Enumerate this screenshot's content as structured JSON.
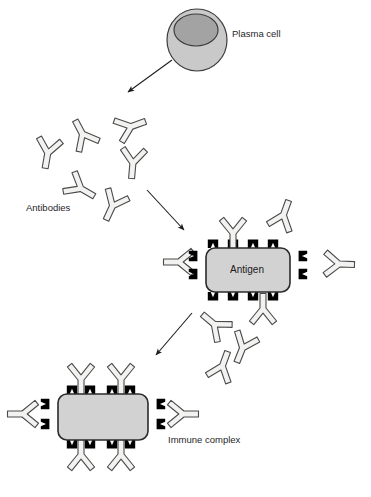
{
  "diagram": {
    "canvas": {
      "width": 371,
      "height": 497,
      "background": "#ffffff"
    },
    "palette": {
      "outline": "#3a3a3a",
      "antibody_fill": "#f2f2f0",
      "antibody_stroke": "#4a4a4a",
      "antigen_fill": "#d2d2d2",
      "antigen_stroke": "#2b2b2b",
      "epitope_fill": "#000000",
      "cell_cytoplasm": "#c9c9c9",
      "cell_nucleus": "#a3a3a3",
      "cell_stroke": "#3d3d3d",
      "arrow": "#1c1c1c",
      "text": "#262626"
    },
    "labels": [
      {
        "id": "plasma-cell",
        "text": "Plasma cell",
        "x": 232,
        "y": 34,
        "anchor": "start"
      },
      {
        "id": "antibodies",
        "text": "Antibodies",
        "x": 26,
        "y": 208,
        "anchor": "start"
      },
      {
        "id": "immune-complex",
        "text": "Immune complex",
        "x": 168,
        "y": 440,
        "anchor": "start"
      }
    ],
    "antigen_label": {
      "text": "Antigen",
      "x": 247,
      "y": 270
    },
    "plasma_cell": {
      "name": "plasma-cell",
      "cytoplasm": {
        "cx": 197,
        "cy": 40,
        "rx": 30,
        "ry": 31
      },
      "nucleus": {
        "cx": 196,
        "cy": 30,
        "rx": 22,
        "ry": 16
      }
    },
    "antigen": {
      "name": "antigen-particle",
      "body": {
        "x": 206,
        "y": 248,
        "width": 84,
        "height": 44,
        "radius": 9
      },
      "epitopes_top": [
        213,
        233,
        253,
        273
      ],
      "epitopes_bottom": [
        213,
        233,
        253,
        273
      ],
      "epitopes_left": [
        256,
        274
      ],
      "epitopes_right": [
        256,
        274
      ]
    },
    "immune_complex": {
      "name": "immune-complex-particle",
      "body": {
        "x": 58,
        "y": 394,
        "width": 90,
        "height": 46,
        "radius": 9
      },
      "epitopes_top": [
        72,
        90,
        112,
        130
      ],
      "epitopes_bottom": [
        72,
        90,
        112,
        130
      ],
      "epitopes_left": [
        404,
        424
      ],
      "epitopes_right": [
        404,
        424
      ]
    },
    "arrows": [
      {
        "id": "arrow-cell-to-antibodies",
        "x1": 172,
        "y1": 60,
        "x2": 128,
        "y2": 92
      },
      {
        "id": "arrow-antibodies-to-antigen",
        "x1": 147,
        "y1": 190,
        "x2": 184,
        "y2": 230
      },
      {
        "id": "arrow-antigen-to-complex",
        "x1": 192,
        "y1": 313,
        "x2": 156,
        "y2": 355
      }
    ],
    "free_antibodies": [
      {
        "id": "antibody-1",
        "x": 48,
        "y": 152,
        "rotation": 10,
        "scale": 1.0
      },
      {
        "id": "antibody-2",
        "x": 83,
        "y": 135,
        "rotation": 152,
        "scale": 1.0
      },
      {
        "id": "antibody-3",
        "x": 130,
        "y": 127,
        "rotation": 250,
        "scale": 1.0
      },
      {
        "id": "antibody-4",
        "x": 133,
        "y": 162,
        "rotation": 5,
        "scale": 1.0
      },
      {
        "id": "antibody-5",
        "x": 80,
        "y": 188,
        "rotation": 300,
        "scale": 1.0
      },
      {
        "id": "antibody-6",
        "x": 113,
        "y": 205,
        "rotation": 25,
        "scale": 1.0
      },
      {
        "id": "antibody-7",
        "x": 180,
        "y": 262,
        "rotation": 90,
        "scale": 1.0
      },
      {
        "id": "antibody-8",
        "x": 283,
        "y": 216,
        "rotation": 200,
        "scale": 1.0
      },
      {
        "id": "antibody-9",
        "x": 338,
        "y": 264,
        "rotation": 272,
        "scale": 1.0
      },
      {
        "id": "antibody-10",
        "x": 215,
        "y": 325,
        "rotation": 130,
        "scale": 1.0
      },
      {
        "id": "antibody-11",
        "x": 243,
        "y": 347,
        "rotation": 22,
        "scale": 1.0
      },
      {
        "id": "antibody-12",
        "x": 222,
        "y": 367,
        "rotation": 200,
        "scale": 1.0
      }
    ],
    "bound_antibodies_antigen": [
      {
        "id": "bound-antibody-top",
        "x": 233,
        "y": 232,
        "rotation": 0
      },
      {
        "id": "bound-antibody-bottom",
        "x": 263,
        "y": 310,
        "rotation": 180
      }
    ],
    "bound_antibodies_complex": [
      {
        "id": "complex-antibody-top-left",
        "x": 81,
        "y": 378,
        "rotation": 0
      },
      {
        "id": "complex-antibody-top-right",
        "x": 121,
        "y": 378,
        "rotation": 0
      },
      {
        "id": "complex-antibody-bottom-left",
        "x": 81,
        "y": 456,
        "rotation": 180
      },
      {
        "id": "complex-antibody-bottom-right",
        "x": 121,
        "y": 456,
        "rotation": 180
      },
      {
        "id": "complex-antibody-left",
        "x": 24,
        "y": 414,
        "rotation": 90
      },
      {
        "id": "complex-antibody-right",
        "x": 182,
        "y": 414,
        "rotation": 270
      }
    ]
  }
}
